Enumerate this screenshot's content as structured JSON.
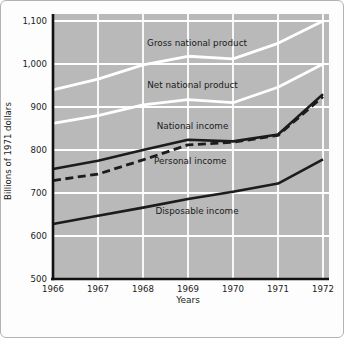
{
  "chart_data": {
    "type": "line",
    "title": "",
    "ylabel": "Billions of 1971 dollars",
    "xlabel": "Years",
    "xlim": [
      1966,
      1972
    ],
    "ylim": [
      500,
      1100
    ],
    "grid": true,
    "legend_position": "inline-annotations",
    "colors": {
      "plot_background": "#b9b9b9",
      "gridline": "#ffffff",
      "white_series": "#ffffff",
      "dark_series": "#1c1c1c",
      "axis_spine": "#111111",
      "text": "#1a1a1a"
    },
    "x": [
      1966,
      1967,
      1968,
      1969,
      1970,
      1971,
      1972
    ],
    "series": [
      {
        "name": "Gross national product",
        "color": "#ffffff",
        "dash": "solid",
        "width": 2.8,
        "values": [
          940,
          965,
          998,
          1018,
          1012,
          1048,
          1100
        ]
      },
      {
        "name": "Net national product",
        "color": "#ffffff",
        "dash": "solid",
        "width": 2.8,
        "values": [
          862,
          880,
          905,
          917,
          910,
          946,
          1000
        ]
      },
      {
        "name": "Disposable income",
        "color": "#1c1c1c",
        "dash": "solid",
        "width": 2.6,
        "values": [
          628,
          647,
          666,
          686,
          703,
          722,
          778
        ]
      },
      {
        "name": "National income",
        "color": "#1c1c1c",
        "dash": "solid",
        "width": 2.6,
        "values": [
          756,
          775,
          800,
          824,
          820,
          836,
          930
        ]
      },
      {
        "name": "Personal income",
        "color": "#1c1c1c",
        "dash": "dashed",
        "width": 2.8,
        "values": [
          729,
          744,
          777,
          812,
          818,
          834,
          924
        ]
      }
    ],
    "annotations": [
      {
        "text": "Gross national product",
        "x": 1969.2,
        "y": 1048
      },
      {
        "text": "Net national product",
        "x": 1969.1,
        "y": 951
      },
      {
        "text": "National income",
        "x": 1969.1,
        "y": 856
      },
      {
        "text": "Personal income",
        "x": 1969.05,
        "y": 774
      },
      {
        "text": "Disposable income",
        "x": 1969.2,
        "y": 658
      }
    ],
    "y_ticks": [
      {
        "label": "1,100",
        "value": 1100
      },
      {
        "label": "1,000",
        "value": 1000
      },
      {
        "label": "900",
        "value": 900
      },
      {
        "label": "800",
        "value": 800
      },
      {
        "label": "700",
        "value": 700
      },
      {
        "label": "600",
        "value": 600
      },
      {
        "label": "500",
        "value": 500
      }
    ],
    "x_ticks": [
      {
        "label": "1966",
        "value": 1966
      },
      {
        "label": "1967",
        "value": 1967
      },
      {
        "label": "1968",
        "value": 1968
      },
      {
        "label": "1969",
        "value": 1969
      },
      {
        "label": "1970",
        "value": 1970
      },
      {
        "label": "1971",
        "value": 1971
      },
      {
        "label": "1972",
        "value": 1972
      }
    ]
  }
}
